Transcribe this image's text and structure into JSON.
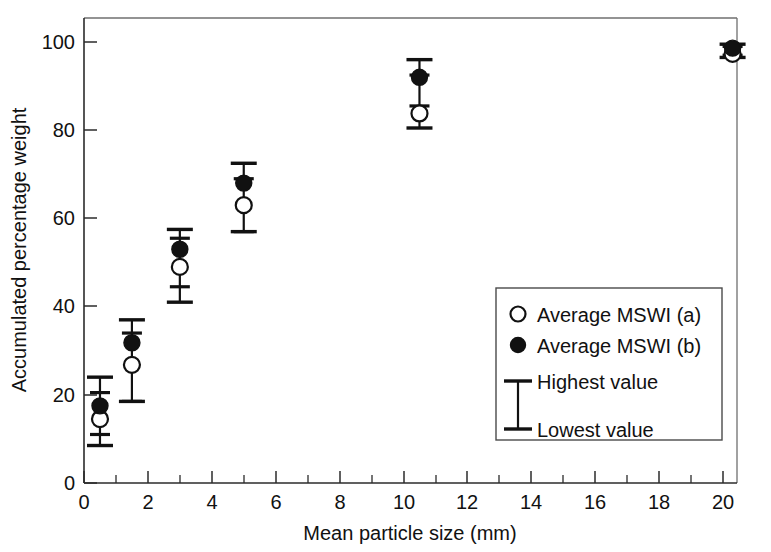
{
  "chart_data": {
    "type": "scatter",
    "title": "",
    "xlabel": "Mean particle size (mm)",
    "ylabel": "Accumulated percentage weight",
    "xlim": [
      0,
      20.8
    ],
    "ylim": [
      0,
      104
    ],
    "x_ticks": [
      0,
      2,
      4,
      6,
      8,
      10,
      12,
      14,
      16,
      18,
      20
    ],
    "x_tick_labels": [
      "0",
      "2",
      "4",
      "6",
      "8",
      "10",
      "12",
      "14",
      "16",
      "18",
      "20"
    ],
    "x_minor_ticks": [
      1,
      3,
      5,
      7,
      9,
      11,
      13,
      15,
      17,
      19
    ],
    "y_ticks": [
      0,
      20,
      40,
      60,
      80,
      100
    ],
    "y_tick_labels": [
      "0",
      "20",
      "40",
      "60",
      "80",
      "100"
    ],
    "grid": false,
    "legend_position": "lower-right",
    "x": [
      0.5,
      1.5,
      3.0,
      5.0,
      10.5,
      20.3
    ],
    "series": [
      {
        "name": "Average MSWI (a)",
        "marker": "open-circle",
        "values": [
          14.5,
          26.8,
          49.0,
          63.0,
          83.8,
          97.3
        ]
      },
      {
        "name": "Average MSWI (b)",
        "marker": "filled-circle",
        "values": [
          17.5,
          31.8,
          53.0,
          68.0,
          92.0,
          98.6
        ]
      }
    ],
    "error_bars": [
      {
        "x": 0.5,
        "highest": 24.0,
        "lowest": 8.5,
        "inner_high": 20.5,
        "inner_low": 11.0
      },
      {
        "x": 1.5,
        "highest": 37.0,
        "lowest": 18.5,
        "inner_high": 34.0,
        "inner_low": 18.5
      },
      {
        "x": 3.0,
        "highest": 57.5,
        "lowest": 41.0,
        "inner_high": 55.5,
        "inner_low": 44.5
      },
      {
        "x": 5.0,
        "highest": 72.5,
        "lowest": 57.0,
        "inner_high": 69.0,
        "inner_low": 57.0
      },
      {
        "x": 10.5,
        "highest": 96.0,
        "lowest": 80.5,
        "inner_high": 92.5,
        "inner_low": 85.5
      },
      {
        "x": 20.3,
        "highest": 99.5,
        "lowest": 96.5,
        "inner_high": 99.0,
        "inner_low": 97.0
      }
    ]
  },
  "axes": {
    "y_title": "Accumulated percentage weight",
    "x_title": "Mean particle size (mm)",
    "y_labels": [
      "100",
      "80",
      "60",
      "40",
      "20",
      "0"
    ],
    "x_labels": [
      "0",
      "2",
      "4",
      "6",
      "8",
      "10",
      "12",
      "14",
      "16",
      "18",
      "20"
    ]
  },
  "legend": {
    "entries": [
      {
        "label": "Average MSWI (a)",
        "marker": "open-circle"
      },
      {
        "label": "Average MSWI (b)",
        "marker": "filled-circle"
      },
      {
        "label": "Highest value",
        "marker": "error-cap-top"
      },
      {
        "label": "Lowest value",
        "marker": "error-cap-bottom"
      }
    ]
  },
  "colors": {
    "ink": "#111111",
    "frame": "#6f6f6f",
    "background": "#ffffff"
  }
}
